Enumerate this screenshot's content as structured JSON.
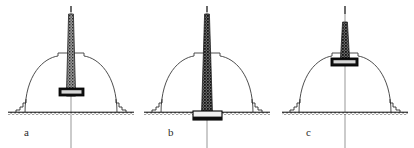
{
  "figure": {
    "kind": "line-drawing",
    "background_color": "#ffffff",
    "ink_color": "#1a1a1a",
    "line_color": "#333333",
    "shaft_fill_color": "#6e6e6e",
    "block_fill_color": "#111111",
    "panel_count": 3
  },
  "panels": [
    {
      "id": "a",
      "label": "a",
      "label_x": 24,
      "label_y": 136,
      "center_x": 71,
      "ground_y": 113,
      "ground_x1": 8,
      "ground_x2": 134,
      "dome": {
        "radius_x": 46,
        "radius_y": 50,
        "apex_y": 57
      },
      "drum": {
        "x": 58,
        "y": 53,
        "width": 26,
        "height": 6
      },
      "shaft": {
        "top_y": 14,
        "bottom_y": 96,
        "top_width": 5,
        "bottom_width": 9
      },
      "block": {
        "x": 59,
        "y": 88,
        "width": 25,
        "height": 8
      },
      "block_position": "mid-shaft, below dome apex",
      "centerline": {
        "top_y": 6,
        "bottom_y": 148
      },
      "top_tick": {
        "x": 71,
        "y1": 6,
        "y2": 12
      },
      "steps_left": [
        [
          22,
          113
        ],
        [
          22,
          108
        ],
        [
          26,
          108
        ],
        [
          26,
          104
        ],
        [
          30,
          104
        ],
        [
          30,
          100
        ]
      ],
      "steps_right": [
        [
          120,
          113
        ],
        [
          120,
          108
        ],
        [
          116,
          108
        ],
        [
          116,
          104
        ],
        [
          112,
          104
        ],
        [
          112,
          100
        ]
      ]
    },
    {
      "id": "b",
      "label": "b",
      "label_x": 168,
      "label_y": 136,
      "center_x": 207,
      "ground_y": 113,
      "ground_x1": 144,
      "ground_x2": 270,
      "dome": {
        "radius_x": 46,
        "radius_y": 50,
        "apex_y": 57
      },
      "drum": {
        "x": 194,
        "y": 53,
        "width": 26,
        "height": 6
      },
      "shaft": {
        "top_y": 14,
        "bottom_y": 112,
        "top_width": 5,
        "bottom_width": 11
      },
      "block": {
        "x": 193,
        "y": 111,
        "width": 29,
        "height": 9
      },
      "block_position": "at ground level, base of shaft",
      "centerline": {
        "top_y": 6,
        "bottom_y": 148
      },
      "top_tick": {
        "x": 207,
        "y1": 6,
        "y2": 12
      },
      "steps_left": [
        [
          158,
          113
        ],
        [
          158,
          108
        ],
        [
          162,
          108
        ],
        [
          162,
          104
        ],
        [
          166,
          104
        ],
        [
          166,
          100
        ]
      ],
      "steps_right": [
        [
          256,
          113
        ],
        [
          256,
          108
        ],
        [
          252,
          108
        ],
        [
          252,
          104
        ],
        [
          248,
          104
        ],
        [
          248,
          100
        ]
      ]
    },
    {
      "id": "c",
      "label": "c",
      "label_x": 306,
      "label_y": 136,
      "center_x": 345,
      "ground_y": 113,
      "ground_x1": 282,
      "ground_x2": 408,
      "dome": {
        "radius_x": 46,
        "radius_y": 50,
        "apex_y": 57
      },
      "drum": {
        "x": 332,
        "y": 53,
        "width": 26,
        "height": 6
      },
      "shaft": {
        "top_y": 22,
        "bottom_y": 60,
        "top_width": 5,
        "bottom_width": 9
      },
      "block": {
        "x": 331,
        "y": 58,
        "width": 27,
        "height": 8
      },
      "block_position": "at dome apex, on the drum",
      "centerline": {
        "top_y": 6,
        "bottom_y": 148
      },
      "top_tick": {
        "x": 345,
        "y1": 6,
        "y2": 14
      },
      "steps_left": [
        [
          296,
          113
        ],
        [
          296,
          108
        ],
        [
          300,
          108
        ],
        [
          300,
          104
        ],
        [
          304,
          104
        ],
        [
          304,
          100
        ]
      ],
      "steps_right": [
        [
          394,
          113
        ],
        [
          394,
          108
        ],
        [
          390,
          108
        ],
        [
          390,
          104
        ],
        [
          386,
          104
        ],
        [
          386,
          100
        ]
      ]
    }
  ]
}
